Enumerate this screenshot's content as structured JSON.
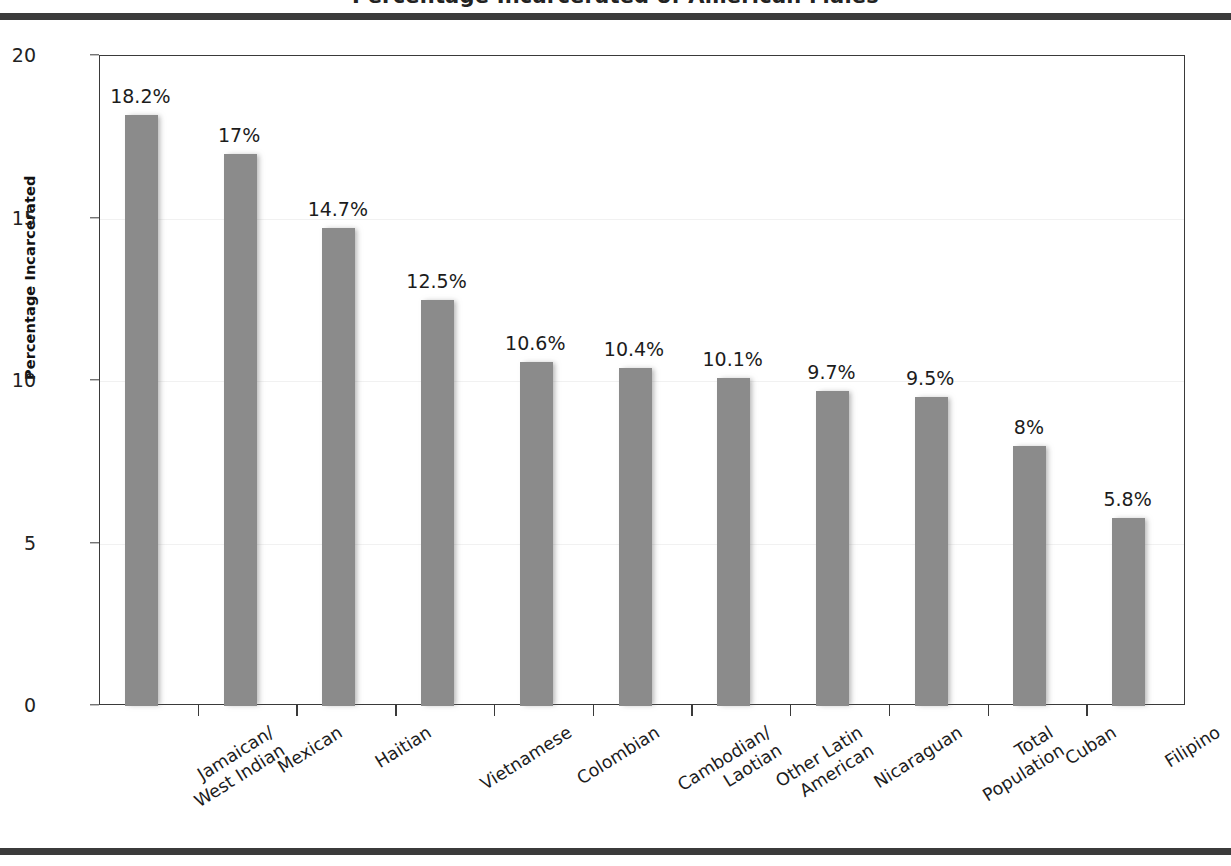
{
  "page": {
    "title_partial": "Percentage Incarcerated of American Males",
    "background": "#ffffff",
    "rule_color": "#3b3b3b"
  },
  "chart_data": {
    "type": "bar",
    "title": "Percentage Incarcerated of American Males",
    "xlabel": "",
    "ylabel": "Percentage Incarcerated",
    "ylim": [
      0,
      20
    ],
    "yticks": [
      0,
      5,
      10,
      15,
      20
    ],
    "ytick_labels": [
      "0",
      "5",
      "10",
      "15",
      "20"
    ],
    "grid": true,
    "legend": null,
    "bar_color": "#8b8b8b",
    "value_suffix": "%",
    "categories": [
      "Jamaican/ West Indian",
      "Mexican",
      "Haitian",
      "Vietnamese",
      "Colombian",
      "Cambodian/ Laotian",
      "Other Latin American",
      "Nicaraguan",
      "Total Population",
      "Cuban",
      "Filipino"
    ],
    "category_lines": [
      [
        "Jamaican/",
        "West Indian"
      ],
      [
        "Mexican"
      ],
      [
        "Haitian"
      ],
      [
        "Vietnamese"
      ],
      [
        "Colombian"
      ],
      [
        "Cambodian/",
        "Laotian"
      ],
      [
        "Other Latin",
        "American"
      ],
      [
        "Nicaraguan"
      ],
      [
        "Total",
        "Population"
      ],
      [
        "Cuban"
      ],
      [
        "Filipino"
      ]
    ],
    "values": [
      18.2,
      17,
      14.7,
      12.5,
      10.6,
      10.4,
      10.1,
      9.7,
      9.5,
      8,
      5.8
    ],
    "value_labels": [
      "18.2%",
      "17%",
      "14.7%",
      "12.5%",
      "10.6%",
      "10.4%",
      "10.1%",
      "9.7%",
      "9.5%",
      "8%",
      "5.8%"
    ]
  }
}
